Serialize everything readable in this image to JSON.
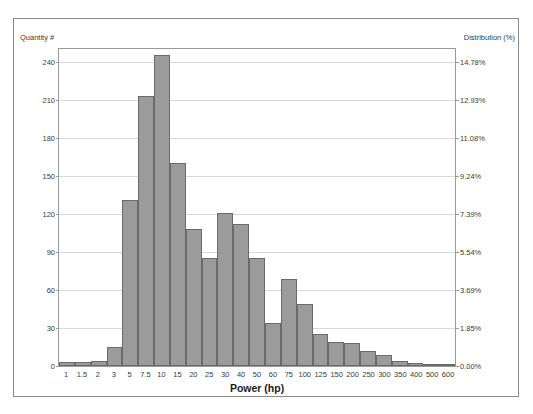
{
  "chart_data": {
    "type": "bar",
    "title": "",
    "xlabel": "Power (hp)",
    "ylabel": "Quantity #",
    "ylabel_right": "Distribution (%)",
    "categories": [
      "1",
      "1.5",
      "2",
      "3",
      "5",
      "7.5",
      "10",
      "15",
      "20",
      "25",
      "30",
      "40",
      "50",
      "60",
      "75",
      "100",
      "125",
      "150",
      "200",
      "250",
      "300",
      "350",
      "400",
      "500",
      "600"
    ],
    "values": [
      3,
      3,
      4,
      15,
      131,
      213,
      245,
      160,
      108,
      85,
      121,
      112,
      85,
      34,
      69,
      49,
      25,
      19,
      18,
      12,
      9,
      4,
      2,
      1,
      1
    ],
    "ylim": [
      0,
      250
    ],
    "yticks": [
      "0",
      "30",
      "60",
      "90",
      "120",
      "150",
      "180",
      "210",
      "240"
    ],
    "ytick_values": [
      0,
      30,
      60,
      90,
      120,
      150,
      180,
      210,
      240
    ],
    "yticks_right": [
      "0.00%",
      "1.85%",
      "3.69%",
      "5.54%",
      "7.39%",
      "9.24%",
      "11.08%",
      "12.93%",
      "14.78%"
    ],
    "ytick_right_values": [
      0,
      30,
      60,
      90,
      120,
      150,
      180,
      210,
      240
    ],
    "grid": true,
    "legend": "none",
    "bar_color": "#9b9b9b",
    "bar_border_color": "#6a6a6a",
    "grid_color": "#d8d8d8",
    "frame_color": "#8a8a8a"
  }
}
